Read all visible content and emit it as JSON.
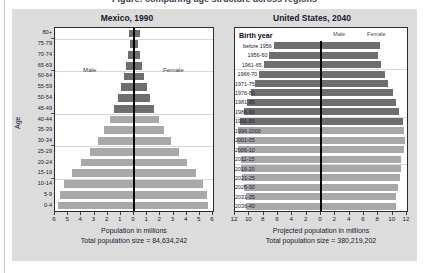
{
  "caption_cropped": "Figure: comparing age structure across regions",
  "chart_data": [
    {
      "type": "bar",
      "subtype": "population-pyramid",
      "title": "Mexico, 1990",
      "xlabel": "Population in millions",
      "total_label": "Total population size = 84,634,242",
      "ylabel": "Age",
      "male_legend": "Male",
      "female_legend": "Female",
      "xlim": [
        -6,
        6
      ],
      "xticks": [
        "6",
        "5",
        "4",
        "3",
        "2",
        "1",
        "0",
        "1",
        "2",
        "3",
        "4",
        "5",
        "6"
      ],
      "grid": true,
      "categories": [
        "80+",
        "75-79",
        "70-74",
        "65-69",
        "60-64",
        "55-59",
        "50-54",
        "45-49",
        "40-44",
        "35-39",
        "30-34",
        "25-29",
        "20-24",
        "15-19",
        "10-14",
        "5-9",
        "0-4"
      ],
      "series": [
        {
          "name": "Male",
          "values": [
            0.4,
            0.3,
            0.45,
            0.6,
            0.75,
            0.95,
            1.2,
            1.5,
            1.85,
            2.25,
            2.75,
            3.35,
            4.0,
            4.7,
            5.3,
            5.6,
            5.75
          ]
        },
        {
          "name": "Female",
          "values": [
            0.45,
            0.32,
            0.48,
            0.63,
            0.78,
            1.0,
            1.25,
            1.55,
            1.9,
            2.3,
            2.8,
            3.4,
            4.05,
            4.7,
            5.25,
            5.55,
            5.65
          ]
        }
      ],
      "shade_by_cohort": [
        "dark",
        "dark",
        "dark",
        "dark",
        "dark",
        "dark",
        "dark",
        "dark",
        "light",
        "light",
        "light",
        "light",
        "light",
        "light",
        "light",
        "light",
        "light"
      ]
    },
    {
      "type": "bar",
      "subtype": "population-pyramid",
      "title": "United States, 2040",
      "xlabel": "Projected population in millions",
      "total_label": "Total population size = 380,219,202",
      "ylabel": "Birth year",
      "male_legend": "Male",
      "female_legend": "Female",
      "xlim": [
        -12,
        12
      ],
      "xticks": [
        "12",
        "10",
        "8",
        "6",
        "4",
        "2",
        "0",
        "2",
        "4",
        "6",
        "8",
        "10",
        "12"
      ],
      "grid": true,
      "categories": [
        "before 1956",
        "1956-60",
        "1961-65",
        "1966-70",
        "1971-75",
        "1976-80",
        "1981-85",
        "1986-90",
        "1991-95",
        "1996-2000",
        "2001-05",
        "2006-10",
        "2011-15",
        "2016-20",
        "2021-25",
        "2026-30",
        "2031-35",
        "2036-40"
      ],
      "series": [
        {
          "name": "Male",
          "values": [
            6.6,
            7.2,
            8.0,
            8.6,
            9.2,
            9.8,
            10.3,
            10.8,
            11.3,
            11.6,
            11.7,
            11.6,
            11.2,
            11.1,
            11.0,
            10.7,
            10.5,
            10.4
          ]
        },
        {
          "name": "Female",
          "values": [
            8.2,
            8.0,
            8.4,
            8.9,
            9.4,
            10.0,
            10.5,
            10.9,
            11.4,
            11.6,
            11.7,
            11.6,
            11.2,
            11.1,
            11.0,
            10.7,
            10.5,
            10.4
          ]
        }
      ],
      "shade_by_cohort": [
        "dark",
        "dark",
        "dark",
        "dark",
        "dark",
        "dark",
        "dark",
        "dark",
        "dark",
        "light",
        "light",
        "light",
        "light",
        "light",
        "light",
        "light",
        "light",
        "light"
      ]
    }
  ],
  "colors": {
    "panel_bg": "#dcdcdc",
    "plot_bg": "#ffffff",
    "bar_dark": "#6e6e6e",
    "bar_light": "#a8a8a8",
    "axis": "#000000",
    "grid": "#d7d7e0",
    "text": "#1a1a2e"
  }
}
